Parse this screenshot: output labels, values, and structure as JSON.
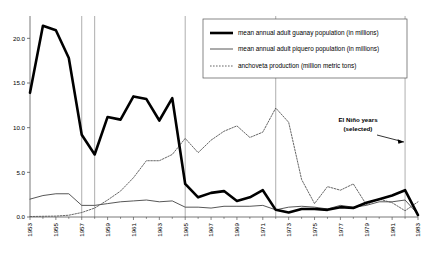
{
  "chart_data": {
    "type": "line",
    "title": "",
    "xlabel": "",
    "ylabel": "",
    "xlim": [
      1953,
      1983
    ],
    "ylim": [
      0.0,
      22.5
    ],
    "grid": false,
    "legend_position": "top-right",
    "y_ticks": [
      "0.0",
      "5.0",
      "10.0",
      "15.0",
      "20.0"
    ],
    "y_tick_values": [
      0.0,
      5.0,
      10.0,
      15.0,
      20.0
    ],
    "x_ticks": [
      "1953",
      "1955",
      "1957",
      "1959",
      "1961",
      "1963",
      "1965",
      "1967",
      "1969",
      "1971",
      "1973",
      "1975",
      "1977",
      "1979",
      "1981",
      "1983"
    ],
    "x_tick_values": [
      1953,
      1955,
      1957,
      1959,
      1961,
      1963,
      1965,
      1967,
      1969,
      1971,
      1973,
      1975,
      1977,
      1979,
      1981,
      1983
    ],
    "x": [
      1953,
      1954,
      1955,
      1956,
      1957,
      1958,
      1959,
      1960,
      1961,
      1962,
      1963,
      1964,
      1965,
      1966,
      1967,
      1968,
      1969,
      1970,
      1971,
      1972,
      1973,
      1974,
      1975,
      1976,
      1977,
      1978,
      1979,
      1980,
      1981,
      1982,
      1983
    ],
    "series": [
      {
        "name": "mean annual adult guanay population (in millions)",
        "key": "guanay",
        "style": "solid-thick",
        "color": "#000000",
        "values": [
          13.9,
          21.4,
          20.9,
          17.8,
          9.2,
          7.0,
          11.2,
          10.9,
          13.5,
          13.2,
          10.8,
          13.3,
          3.7,
          2.2,
          2.7,
          2.9,
          1.8,
          2.2,
          3.0,
          0.8,
          0.5,
          0.9,
          0.9,
          0.8,
          1.1,
          1.0,
          1.6,
          2.0,
          2.4,
          3.0,
          0.2
        ]
      },
      {
        "name": "mean annual adult piquero population (in millions)",
        "key": "piquero",
        "style": "solid-thin",
        "color": "#444444",
        "values": [
          2.0,
          2.4,
          2.6,
          2.6,
          1.3,
          1.3,
          1.5,
          1.7,
          1.8,
          1.9,
          1.7,
          1.8,
          1.1,
          1.1,
          1.0,
          1.2,
          1.2,
          1.2,
          1.3,
          0.8,
          1.1,
          1.2,
          1.1,
          0.9,
          1.3,
          1.1,
          1.3,
          1.7,
          1.7,
          1.9,
          0.3
        ]
      },
      {
        "name": "anchoveta production (million metric tons)",
        "key": "anchoveta",
        "style": "dotted",
        "color": "#555555",
        "values": [
          0.05,
          0.08,
          0.1,
          0.2,
          0.5,
          1.0,
          1.9,
          2.9,
          4.4,
          6.3,
          6.3,
          7.0,
          8.8,
          7.2,
          8.6,
          9.6,
          10.2,
          8.9,
          9.5,
          12.2,
          10.6,
          4.2,
          1.5,
          3.4,
          3.0,
          3.7,
          1.4,
          2.0,
          1.6,
          0.7,
          1.7
        ]
      }
    ],
    "vertical_markers": {
      "label": "El Niño years",
      "sublabel": "(selected)",
      "years": [
        1957,
        1958,
        1965,
        1972,
        1982
      ],
      "color": "#999999"
    }
  },
  "annotation": {
    "line1": "El Niño years",
    "line2": "(selected)"
  }
}
